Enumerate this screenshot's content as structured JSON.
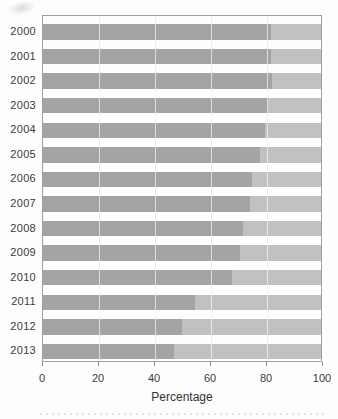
{
  "chart_data": {
    "type": "bar",
    "orientation": "horizontal",
    "stacked": true,
    "title": "",
    "xlabel": "Percentage",
    "ylabel": "",
    "xlim": [
      0,
      100
    ],
    "x_ticks": [
      0,
      20,
      40,
      60,
      80,
      100
    ],
    "x_tick_labels": [
      "0",
      "20",
      "40",
      "60",
      "80",
      "100"
    ],
    "grid": "vertical",
    "legend": "none",
    "categories": [
      "2000",
      "2001",
      "2002",
      "2003",
      "2004",
      "2005",
      "2006",
      "2007",
      "2008",
      "2009",
      "2010",
      "2011",
      "2012",
      "2013"
    ],
    "series": [
      {
        "name": "dark-gray-segment",
        "color": "#a4a4a4",
        "values": [
          82,
          82,
          82.5,
          81,
          80,
          78,
          75,
          74.5,
          72,
          71,
          68,
          54.5,
          50,
          47
        ]
      },
      {
        "name": "light-gray-segment",
        "color": "#c1c1c1",
        "values": [
          18,
          18,
          17.5,
          19,
          20,
          22,
          25,
          25.5,
          28,
          29,
          32,
          45.5,
          50,
          53
        ]
      }
    ],
    "colors": {
      "plot_border": "#9f9f9f",
      "gridline": "#d2d2d2",
      "axis_text": "#3b3b3b"
    }
  }
}
